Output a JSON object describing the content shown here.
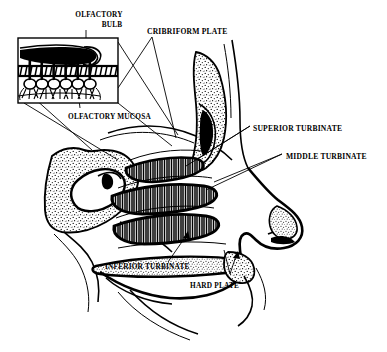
{
  "figure": {
    "background_color": "#ffffff",
    "ink_color": "#000000",
    "width": 387,
    "height": 352
  },
  "labels": {
    "olfactory_bulb_line1": "OLFACTORY",
    "olfactory_bulb_line2": "BULB",
    "cribriform_plate": "CRIBRIFORM PLATE",
    "olfactory_mucosa": "OLFACTORY MUCOSA",
    "superior_turbinate": "SUPERIOR TURBINATE",
    "middle_turbinate": "MIDDLE TURBINATE",
    "inferior_turbinate": "INFERIOR TURBINATE",
    "hard_plate": "HARD PLATE"
  },
  "inset": {
    "name": "olfactory-epithelium-magnification",
    "box": {
      "x": 18,
      "y": 38,
      "width": 100,
      "height": 65
    },
    "contents": [
      "olfactory-bulb-body",
      "cribriform-plate-band",
      "olfactory-nerve-fibers",
      "olfactory-mucosa-layer"
    ]
  },
  "structures": [
    {
      "name": "sphenoid-bone-stipple"
    },
    {
      "name": "frontal-sinus-stipple"
    },
    {
      "name": "superior-turbinate-scroll"
    },
    {
      "name": "middle-turbinate-scroll"
    },
    {
      "name": "inferior-turbinate-scroll"
    },
    {
      "name": "hard-palate-band"
    },
    {
      "name": "soft-palate-curve"
    },
    {
      "name": "tongue-outline"
    },
    {
      "name": "nose-profile-outline"
    },
    {
      "name": "nasal-cartilage-stipple"
    },
    {
      "name": "nasal-bone-stipple"
    }
  ]
}
